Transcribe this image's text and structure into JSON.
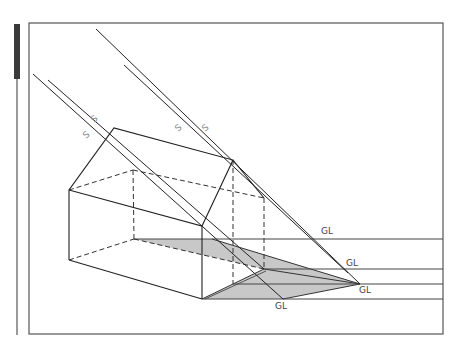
{
  "figure": {
    "type": "technical drawing — shadow projection of a gabled house",
    "labels": {
      "sun_ray": "S",
      "ground_line": "GL"
    },
    "sun_ray_labels": [
      "S",
      "S",
      "S",
      "S"
    ],
    "ground_line_labels": [
      "GL",
      "GL",
      "GL",
      "GL"
    ],
    "colors": {
      "line": "#222222",
      "frame": "#555555",
      "shadow_fill": "#c8c8c8",
      "side_tab": "#3a3a3a",
      "label_gray": "#888888"
    }
  }
}
